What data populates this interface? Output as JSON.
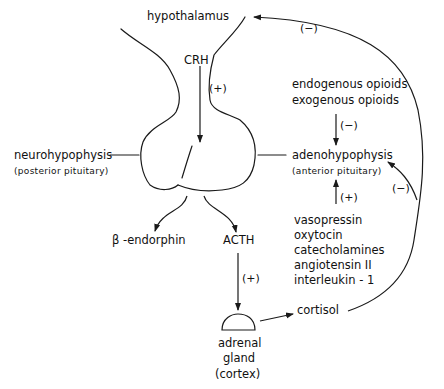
{
  "diagram": {
    "colors": {
      "ink": "#111111",
      "background": "#ffffff"
    },
    "nodes": {
      "hypothalamus": "hypothalamus",
      "crh": "CRH",
      "neurohypophysis": "neurohypophysis",
      "neurohypophysis_sub": "(posterior pituitary)",
      "adenohypophysis": "adenohypophysis",
      "adenohypophysis_sub": "(anterior pituitary)",
      "beta_endorphin": "β -endorphin",
      "acth": "ACTH",
      "adrenal_line1": "adrenal",
      "adrenal_line2": "gland",
      "adrenal_line3": "(cortex)",
      "cortisol": "cortisol"
    },
    "inhibitors": [
      "endogenous opioids",
      "exogenous opioids"
    ],
    "stimulators": [
      "vasopressin",
      "oxytocin",
      "catecholamines",
      "angiotensin II",
      "interleukin - 1"
    ],
    "signs": {
      "crh_effect": "(+)",
      "opioid_effect": "(−)",
      "stimulator_effect": "(+)",
      "acth_effect": "(+)",
      "cortisol_to_hypothalamus": "(−)",
      "cortisol_to_adenohypophysis": "(−)"
    },
    "edges": [
      {
        "from": "hypothalamus",
        "to": "adenohypophysis",
        "label": "CRH",
        "sign": "(+)"
      },
      {
        "from": "opioids",
        "to": "adenohypophysis",
        "sign": "(−)"
      },
      {
        "from": "stimulators",
        "to": "adenohypophysis",
        "sign": "(+)"
      },
      {
        "from": "pituitary",
        "to": "β-endorphin"
      },
      {
        "from": "pituitary",
        "to": "ACTH"
      },
      {
        "from": "ACTH",
        "to": "adrenal gland (cortex)",
        "sign": "(+)"
      },
      {
        "from": "adrenal gland (cortex)",
        "to": "cortisol"
      },
      {
        "from": "cortisol",
        "to": "hypothalamus",
        "sign": "(−)"
      },
      {
        "from": "cortisol",
        "to": "adenohypophysis",
        "sign": "(−)"
      }
    ]
  }
}
